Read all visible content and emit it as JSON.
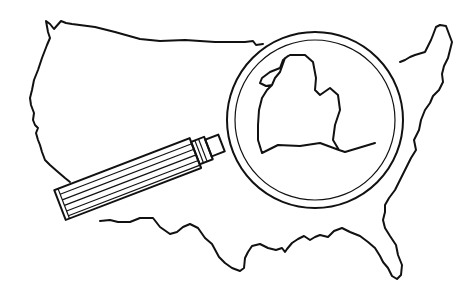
{
  "illustration": {
    "subject": "United States map outline with magnifying glass over Michigan",
    "style": "black line art on white",
    "colors": {
      "ink": "#111111",
      "background": "#ffffff"
    },
    "elements": [
      "us-outline",
      "magnifying-glass",
      "michigan-outline"
    ]
  }
}
